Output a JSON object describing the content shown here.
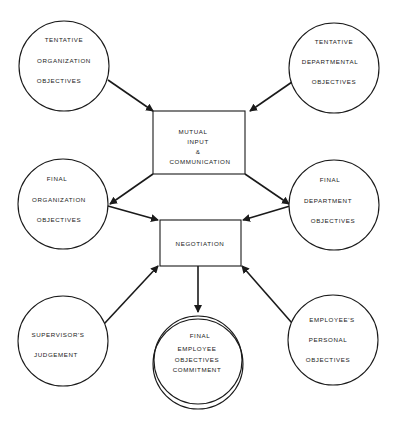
{
  "diagram": {
    "title": "",
    "nodes": {
      "tentative_org": {
        "lines": [
          "TENTATIVE",
          "ORGANIZATION",
          "OBJECTIVES"
        ]
      },
      "tentative_dept": {
        "lines": [
          "TENTATIVE",
          "DEPARTMENTAL",
          "OBJECTIVES"
        ]
      },
      "mutual_input": {
        "lines": [
          "MUTUAL",
          "INPUT",
          "&",
          "COMMUNICATION"
        ]
      },
      "final_org": {
        "lines": [
          "FINAL",
          "ORGANIZATION",
          "OBJECTIVES"
        ]
      },
      "final_dept": {
        "lines": [
          "FINAL",
          "DEPARTMENT",
          "OBJECTIVES"
        ]
      },
      "negotiation": {
        "lines": [
          "NEGOTIATION"
        ]
      },
      "supervisor": {
        "lines": [
          "SUPERVISOR'S",
          "JUDGEMENT"
        ]
      },
      "final_employee": {
        "lines": [
          "FINAL",
          "EMPLOYEE",
          "OBJECTIVES",
          "COMMITMENT"
        ]
      },
      "employee_personal": {
        "lines": [
          "EMPLOYEE'S",
          "PERSONAL",
          "OBJECTIVES"
        ]
      }
    },
    "edges": [
      {
        "from": "tentative_org",
        "to": "mutual_input"
      },
      {
        "from": "tentative_dept",
        "to": "mutual_input"
      },
      {
        "from": "mutual_input",
        "to": "final_org"
      },
      {
        "from": "mutual_input",
        "to": "final_dept"
      },
      {
        "from": "final_org",
        "to": "negotiation"
      },
      {
        "from": "final_dept",
        "to": "negotiation"
      },
      {
        "from": "supervisor",
        "to": "negotiation"
      },
      {
        "from": "employee_personal",
        "to": "negotiation"
      },
      {
        "from": "negotiation",
        "to": "final_employee"
      }
    ]
  }
}
